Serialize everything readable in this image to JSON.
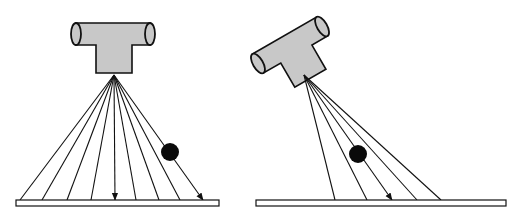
{
  "colors": {
    "background": "#ffffff",
    "stroke": "#111111",
    "tube_fill": "#c8c8c8",
    "plate_fill": "#ffffff",
    "ball": "#0a0a0a"
  },
  "panels": [
    {
      "name": "perpendicular-beam",
      "tube": {
        "orientation": "vertical"
      },
      "source": [
        114,
        75
      ],
      "ray_ends_x": [
        20,
        42,
        67,
        91,
        115,
        136,
        159,
        180,
        203
      ],
      "arrow_rays": [
        4,
        8
      ],
      "ball": {
        "cx": 170,
        "cy": 152,
        "r": 9
      },
      "plate": {
        "x": 16,
        "y": 200,
        "w": 203,
        "h": 6
      }
    },
    {
      "name": "angled-beam",
      "tube": {
        "orientation": "tilted"
      },
      "source": [
        304,
        75
      ],
      "ray_ends_x": [
        335,
        367,
        392,
        417,
        441
      ],
      "arrow_rays": [
        2
      ],
      "ball": {
        "cx": 358,
        "cy": 154,
        "r": 9
      },
      "plate": {
        "x": 256,
        "y": 200,
        "w": 250,
        "h": 6
      }
    }
  ]
}
